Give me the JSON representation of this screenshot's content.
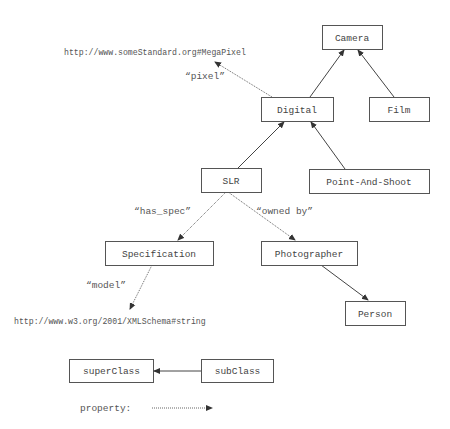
{
  "diagram": {
    "title": "",
    "nodes": [
      {
        "id": "camera",
        "label": "Camera",
        "x": 322,
        "y": 25,
        "w": 60,
        "h": 24
      },
      {
        "id": "digital",
        "label": "Digital",
        "x": 261,
        "y": 97,
        "w": 72,
        "h": 24
      },
      {
        "id": "film",
        "label": "Film",
        "x": 369,
        "y": 97,
        "w": 60,
        "h": 24
      },
      {
        "id": "slr",
        "label": "SLR",
        "x": 201,
        "y": 168,
        "w": 60,
        "h": 24
      },
      {
        "id": "point_and_shoot",
        "label": "Point-And-Shoot",
        "x": 309,
        "y": 169,
        "w": 120,
        "h": 24
      },
      {
        "id": "specification",
        "label": "Specification",
        "x": 105,
        "y": 241,
        "w": 108,
        "h": 24
      },
      {
        "id": "photographer",
        "label": "Photographer",
        "x": 261,
        "y": 241,
        "w": 96,
        "h": 24
      },
      {
        "id": "person",
        "label": "Person",
        "x": 345,
        "y": 301,
        "w": 60,
        "h": 24
      }
    ],
    "literals": [
      {
        "id": "megapixel_uri",
        "text": "http://www.someStandard.org#MegaPixel",
        "x": 64,
        "y": 55
      },
      {
        "id": "xsd_string_uri",
        "text": "http://www.w3.org/2001/XMLSchema#string",
        "x": 14,
        "y": 324
      }
    ],
    "edges": [
      {
        "from": "digital",
        "to": "camera",
        "type": "subClassOf",
        "x1": 310,
        "y1": 97,
        "x2": 344,
        "y2": 50
      },
      {
        "from": "film",
        "to": "camera",
        "type": "subClassOf",
        "x1": 394,
        "y1": 97,
        "x2": 358,
        "y2": 50
      },
      {
        "from": "slr",
        "to": "digital",
        "type": "subClassOf",
        "x1": 238,
        "y1": 168,
        "x2": 284,
        "y2": 122
      },
      {
        "from": "point_and_shoot",
        "to": "digital",
        "type": "subClassOf",
        "x1": 345,
        "y1": 169,
        "x2": 311,
        "y2": 122
      },
      {
        "from": "photographer",
        "to": "person",
        "type": "subClassOf",
        "x1": 321,
        "y1": 265,
        "x2": 368,
        "y2": 300
      },
      {
        "from": "digital",
        "to": "megapixel_uri",
        "type": "property",
        "label": "“pixel”",
        "x1": 272,
        "y1": 97,
        "x2": 215,
        "y2": 62
      },
      {
        "from": "slr",
        "to": "specification",
        "type": "property",
        "label": "“has_spec”",
        "x1": 226,
        "y1": 192,
        "x2": 178,
        "y2": 240
      },
      {
        "from": "slr",
        "to": "photographer",
        "type": "property",
        "label": "“owned by”",
        "x1": 228,
        "y1": 192,
        "x2": 295,
        "y2": 240
      },
      {
        "from": "specification",
        "to": "xsd_string_uri",
        "type": "property",
        "label": "“model”",
        "x1": 152,
        "y1": 265,
        "x2": 130,
        "y2": 309
      }
    ],
    "edge_labels": [
      {
        "text": "“pixel”",
        "x": 185,
        "y": 79
      },
      {
        "text": "“has_spec”",
        "x": 134,
        "y": 214
      },
      {
        "text": "“owned by”",
        "x": 256,
        "y": 214
      },
      {
        "text": "“model”",
        "x": 86,
        "y": 288
      }
    ],
    "legend": {
      "superclass_label": "superClass",
      "subclass_label": "subClass",
      "property_label": "property:",
      "superclass_box": {
        "x": 69,
        "y": 359,
        "w": 84,
        "h": 23
      },
      "subclass_box": {
        "x": 201,
        "y": 359,
        "w": 72,
        "h": 23
      }
    },
    "colors": {
      "stroke": "#555555",
      "text": "#444444",
      "background": "#ffffff"
    }
  }
}
